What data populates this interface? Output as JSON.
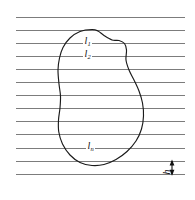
{
  "figure": {
    "background_color": "#ffffff",
    "width": 195,
    "height": 200,
    "line_color": "#6e6e6e",
    "curve_color": "#1a1a1a",
    "dimension_color": "#111111"
  },
  "labels": {
    "chord_first": "l",
    "chord_first_sub": "1",
    "chord_second": "l",
    "chord_second_sub": "2",
    "chord_last": "l",
    "chord_last_sub": "n",
    "spacing": "h"
  },
  "chart_data": {
    "type": "diagram",
    "xlabel": "",
    "ylabel": "",
    "grid": true,
    "legend": "none",
    "xlim": [
      0,
      195
    ],
    "ylim": [
      0,
      200
    ],
    "parallel_lines": {
      "orientation": "horizontal",
      "count": 13,
      "x_start": 16,
      "x_end": 185,
      "spacing_px": 13.1,
      "y_values": [
        17.0,
        30.1,
        43.2,
        56.3,
        69.4,
        82.5,
        95.6,
        108.7,
        121.8,
        134.9,
        148.0,
        161.1,
        174.2
      ],
      "stroke_width": 0.9,
      "color": "#6e6e6e"
    },
    "region_outline": {
      "closed": true,
      "description": "smooth irregular bean/kidney shaped closed curve",
      "bbox": [
        57,
        29,
        144,
        166
      ],
      "points": [
        [
          92,
          29.5
        ],
        [
          80,
          31.5
        ],
        [
          70,
          38.0
        ],
        [
          63,
          47.5
        ],
        [
          59.5,
          58.0
        ],
        [
          58.0,
          70.0
        ],
        [
          59.0,
          84.0
        ],
        [
          60.5,
          96.0
        ],
        [
          60.0,
          108.0
        ],
        [
          58.5,
          120.0
        ],
        [
          58.8,
          132.0
        ],
        [
          62.5,
          144.0
        ],
        [
          70.0,
          155.0
        ],
        [
          80.0,
          162.5
        ],
        [
          92.0,
          165.5
        ],
        [
          104.0,
          164.5
        ],
        [
          116.0,
          159.5
        ],
        [
          127.0,
          151.5
        ],
        [
          136.0,
          141.0
        ],
        [
          141.5,
          129.0
        ],
        [
          143.5,
          116.0
        ],
        [
          142.5,
          103.0
        ],
        [
          139.0,
          91.0
        ],
        [
          134.0,
          80.0
        ],
        [
          129.0,
          70.0
        ],
        [
          126.0,
          60.0
        ],
        [
          126.5,
          50.0
        ],
        [
          124.5,
          43.5
        ],
        [
          119.0,
          40.5
        ],
        [
          112.0,
          40.0
        ],
        [
          104.0,
          35.5
        ],
        [
          98.0,
          31.0
        ]
      ]
    },
    "chord_labels": [
      {
        "text": "l_1",
        "base": "l",
        "sub": "1",
        "x": 88,
        "y": 41,
        "chord_y": 43.2
      },
      {
        "text": "l_2",
        "base": "l",
        "sub": "2",
        "x": 88,
        "y": 54,
        "chord_y": 56.3
      },
      {
        "text": "l_n",
        "base": "l",
        "sub": "n",
        "x": 91,
        "y": 146,
        "chord_y": 148.0
      }
    ],
    "dimension_marker": {
      "label": "h",
      "orientation": "vertical",
      "double_headed": true,
      "x": 172,
      "y_top": 161.1,
      "y_bottom": 174.2,
      "measures": "spacing between adjacent parallel chords",
      "label_x": 164,
      "label_y": 167,
      "label_rotation_deg": -90
    }
  }
}
